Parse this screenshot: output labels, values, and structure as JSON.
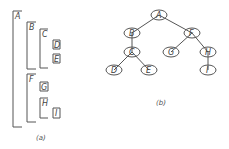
{
  "panels": {
    "a": {
      "caption": "(a)",
      "nodes": [
        {
          "label": "A",
          "level": 0,
          "leaf": false
        },
        {
          "label": "B",
          "level": 1,
          "leaf": false
        },
        {
          "label": "C",
          "level": 2,
          "leaf": false
        },
        {
          "label": "D",
          "level": 3,
          "leaf": true
        },
        {
          "label": "E",
          "level": 3,
          "leaf": true
        },
        {
          "label": "F",
          "level": 1,
          "leaf": false
        },
        {
          "label": "G",
          "level": 2,
          "leaf": true
        },
        {
          "label": "H",
          "level": 2,
          "leaf": false
        },
        {
          "label": "I",
          "level": 3,
          "leaf": true
        }
      ]
    },
    "b": {
      "caption": "(b)",
      "nodes": [
        {
          "label": "A"
        },
        {
          "label": "B"
        },
        {
          "label": "F"
        },
        {
          "label": "C"
        },
        {
          "label": "G"
        },
        {
          "label": "H"
        },
        {
          "label": "D"
        },
        {
          "label": "E"
        },
        {
          "label": "I"
        }
      ],
      "edges": [
        [
          "A",
          "B"
        ],
        [
          "A",
          "F"
        ],
        [
          "B",
          "C"
        ],
        [
          "C",
          "D"
        ],
        [
          "C",
          "E"
        ],
        [
          "F",
          "G"
        ],
        [
          "F",
          "H"
        ],
        [
          "H",
          "I"
        ]
      ]
    }
  }
}
